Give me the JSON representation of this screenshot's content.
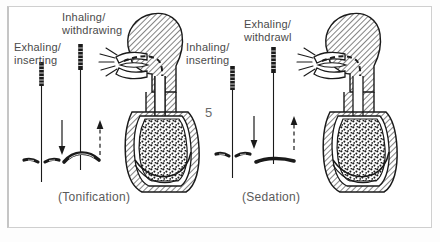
{
  "figure": {
    "number": "5",
    "kind": "anatomical-illustration",
    "style": "black-and-white line drawing, scanned book page",
    "ink_color": "#1a1a1a",
    "text_color": "#4a4a4a",
    "page_background": "#ffffff",
    "frame_color": "#cfcfcf"
  },
  "panels": [
    {
      "id": "tonification",
      "caption": "(Tonification)",
      "needles": [
        {
          "id": "exhaling-inserting",
          "label": "Exhaling/\ninserting",
          "arrow_direction": "down",
          "arrow_style": "solid",
          "skin_line": "dimpled",
          "icon": "needle-icon"
        },
        {
          "id": "inhaling-withdrawing",
          "label": "Inhaling/\nwithdrawing",
          "arrow_direction": "up",
          "arrow_style": "dashed",
          "skin_line": "raised",
          "icon": "needle-icon"
        }
      ],
      "anatomy": {
        "icon": "head-torso-profile-icon",
        "features": [
          "hatched-head",
          "open-mouth",
          "air-puff-lines",
          "trachea",
          "stippled-lung",
          "diaphragm"
        ]
      }
    },
    {
      "id": "sedation",
      "caption": "(Sedation)",
      "needles": [
        {
          "id": "inhaling-inserting",
          "label": "Inhaling/\ninserting",
          "arrow_direction": "down",
          "arrow_style": "solid",
          "skin_line": "dimpled",
          "icon": "needle-icon"
        },
        {
          "id": "exhaling-withdrawl",
          "label": "Exhaling/\nwithdrawl",
          "arrow_direction": "up",
          "arrow_style": "dashed",
          "skin_line": "flat",
          "icon": "needle-icon"
        }
      ],
      "anatomy": {
        "icon": "head-torso-profile-icon",
        "features": [
          "hatched-head",
          "open-mouth",
          "air-puff-lines",
          "trachea",
          "stippled-lung",
          "diaphragm"
        ]
      }
    }
  ]
}
